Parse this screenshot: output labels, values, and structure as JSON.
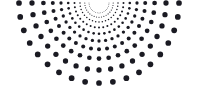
{
  "canvas": {
    "width": 197,
    "height": 98,
    "background_color": "#ffffff",
    "title": "Radial Dot Burst"
  },
  "chart_data": {
    "type": "scatter",
    "subtitle": "Semicircular fan of dots radiating from a top-center apex",
    "xlabel": "",
    "ylabel": "",
    "xlim": [
      0,
      197
    ],
    "ylim": [
      0,
      98
    ],
    "grid": false,
    "legend": null,
    "annotations": [],
    "tick_labels": {
      "x": [],
      "y": []
    },
    "geometry": {
      "shape": "radial-burst",
      "center_x": 99,
      "center_y": 3,
      "angle_start_deg": 0,
      "angle_end_deg": 180,
      "ray_count": 19,
      "ring_count": 10,
      "radius_min": 10,
      "radius_max": 87,
      "radius_growth": "geometric",
      "dot_radius_min": 0.35,
      "dot_radius_max": 2.85,
      "dot_color": "#1a1a22",
      "dot_opacity": 1
    },
    "rays_deg": [
      0,
      10,
      20,
      30,
      40,
      50,
      60,
      70,
      80,
      90,
      100,
      110,
      120,
      130,
      140,
      150,
      160,
      170,
      180
    ],
    "ring_radii": [
      10.0,
      14.2,
      19.0,
      24.5,
      30.8,
      38.0,
      46.2,
      55.6,
      67.0,
      80.0
    ],
    "ring_dot_radii": [
      0.4,
      0.55,
      0.75,
      1.0,
      1.3,
      1.65,
      2.0,
      2.35,
      2.65,
      2.85
    ]
  }
}
